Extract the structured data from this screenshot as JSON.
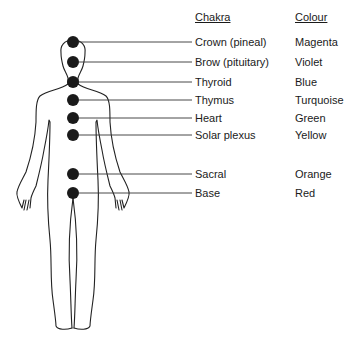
{
  "headers": {
    "chakra": "Chakra",
    "colour": "Colour"
  },
  "chakras": [
    {
      "name": "Crown (pineal)",
      "colour": "Magenta",
      "y": 42
    },
    {
      "name": "Brow (pituitary)",
      "colour": "Violet",
      "y": 62
    },
    {
      "name": "Thyroid",
      "colour": "Blue",
      "y": 82
    },
    {
      "name": "Thymus",
      "colour": "Turquoise",
      "y": 100
    },
    {
      "name": "Heart",
      "colour": "Green",
      "y": 118
    },
    {
      "name": "Solar plexus",
      "colour": "Yellow",
      "y": 135
    },
    {
      "name": "Sacral",
      "colour": "Orange",
      "y": 174
    },
    {
      "name": "Base",
      "colour": "Red",
      "y": 193
    }
  ]
}
